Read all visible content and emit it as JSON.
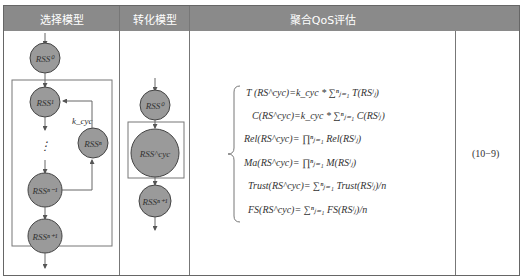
{
  "headers": {
    "select_model": "选择模型",
    "transform_model": "转化模型",
    "aggregate_qos": "聚合QoS评估",
    "equation_number_col": ""
  },
  "select_diagram": {
    "nodes": {
      "rss0": "RSS⁰",
      "rss1": "RSS¹",
      "rssn": "RSSⁿ",
      "rssn_minus_1": "RSSⁿ⁻¹",
      "rssn_plus_1": "RSSⁿ⁺¹"
    },
    "loop_label": "k_cyc",
    "ellipsis": "⋮"
  },
  "transform_diagram": {
    "nodes": {
      "rss0": "RSS⁰",
      "rsscyc": "RSS^cyc",
      "rssn_plus_1": "RSSⁿ⁺¹"
    }
  },
  "formulas": [
    "T (RS^cyc)=k_cyc * ∑ⁿⱼ₌₁ T(RSʲⱼ)",
    "C(RS^cyc)=k_cyc * ∑ⁿⱼ₌₁ C(RSʲⱼ)",
    "Rel(RS^cyc)= ∏ⁿⱼ₌₁ Rel(RSʲⱼ)",
    "Ma(RS^cyc)= ∏ⁿⱼ₌₁ M(RSʲⱼ)",
    "Trust(RS^cyc)= ∑ⁿⱼ₌₁ Trust(RSʲⱼ)/n",
    "FS(RS^cyc)= ∑ⁿⱼ₌₁ FS(RSʲⱼ)/n"
  ],
  "equation_number": "(10−9)",
  "colors": {
    "header_bg": "#8a8a8a",
    "node_fill": "#9a9a9a",
    "node_stroke": "#444444",
    "line": "#666666"
  }
}
